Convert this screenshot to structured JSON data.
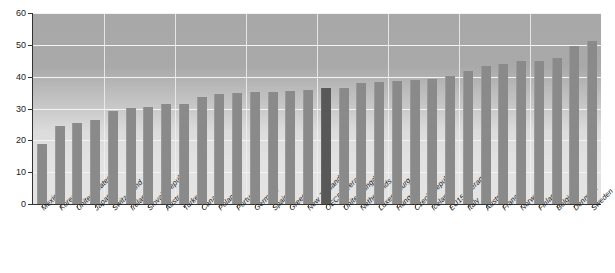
{
  "title": "",
  "chart_data": {
    "type": "bar",
    "title": "",
    "subtitle": "",
    "xlabel": "",
    "ylabel": "",
    "ylim": [
      0,
      60
    ],
    "ytick_step": 10,
    "yticks": [
      "0",
      "10",
      "20",
      "30",
      "40",
      "50",
      "60"
    ],
    "grid": true,
    "legend": "none",
    "highlight_color": "#585858",
    "bar_color": "#8a8a8a",
    "highlight_categories": [
      "OECD average"
    ],
    "categories": [
      "Mexico",
      "Korea",
      "United States",
      "Japan",
      "Switzerland",
      "Ireland",
      "Slovak Republic",
      "Australia",
      "Turkey",
      "Canada",
      "Poland",
      "Portugal",
      "Germany",
      "Spain",
      "Greece",
      "New Zealand",
      "OECD average",
      "United Kingdom",
      "Netherlands",
      "Luxembourg",
      "Hungary",
      "Czech Republic",
      "Iceland",
      "EU15 average",
      "Italy",
      "Austria",
      "France",
      "Norway",
      "Finland",
      "Belgium",
      "Denmark",
      "Sweden"
    ],
    "values": [
      18.8,
      24.5,
      25.6,
      26.4,
      29.3,
      30.2,
      30.4,
      31.3,
      31.4,
      33.7,
      34.7,
      34.8,
      35.1,
      35.1,
      35.4,
      35.9,
      36.3,
      36.4,
      37.9,
      38.3,
      38.6,
      39.0,
      39.3,
      40.3,
      41.7,
      43.2,
      44.1,
      44.8,
      44.9,
      45.8,
      49.5,
      51.2
    ]
  }
}
